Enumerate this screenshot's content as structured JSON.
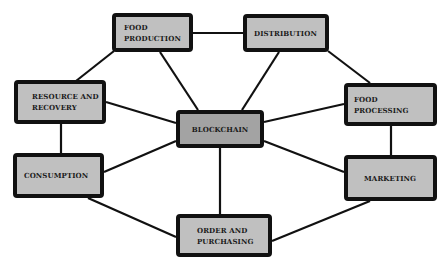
{
  "diagram": {
    "title": "",
    "colors": {
      "node_fill": "#c0c0c0",
      "central_fill": "#a3a3a3",
      "border": "#111111",
      "edge": "#111111",
      "background": "#ffffff"
    },
    "nodes": [
      {
        "id": "food_production",
        "label": "FOOD\nPRODUCTION",
        "x": 112,
        "y": 13,
        "w": 81,
        "h": 39,
        "pad": 8,
        "central": false
      },
      {
        "id": "distribution",
        "label": "DISTRIBUTION",
        "x": 243,
        "y": 14,
        "w": 86,
        "h": 38,
        "pad": 7,
        "central": false
      },
      {
        "id": "resource_recovery",
        "label": "RESOURCE AND\nRECOVERY",
        "x": 14,
        "y": 80,
        "w": 92,
        "h": 44,
        "pad": 14,
        "central": false
      },
      {
        "id": "blockchain",
        "label": "BLOCKCHAIN",
        "x": 176,
        "y": 110,
        "w": 88,
        "h": 38,
        "pad": 0,
        "central": true
      },
      {
        "id": "food_processing",
        "label": "FOOD PROCESSING",
        "x": 344,
        "y": 83,
        "w": 93,
        "h": 43,
        "pad": 6,
        "central": false
      },
      {
        "id": "consumption",
        "label": "CONSUMPTION",
        "x": 13,
        "y": 153,
        "w": 91,
        "h": 45,
        "pad": 7,
        "central": false
      },
      {
        "id": "marketing",
        "label": "MARKETING",
        "x": 344,
        "y": 155,
        "w": 93,
        "h": 46,
        "pad": 16,
        "central": false
      },
      {
        "id": "order_purchasing",
        "label": "ORDER AND\nPURCHASING",
        "x": 176,
        "y": 214,
        "w": 96,
        "h": 43,
        "pad": 17,
        "central": false
      }
    ],
    "edges": [
      {
        "from": "food_production",
        "to": "distribution",
        "x1": 193,
        "y1": 33,
        "x2": 243,
        "y2": 33
      },
      {
        "from": "food_production",
        "to": "resource_recovery",
        "x1": 114,
        "y1": 51,
        "x2": 76,
        "y2": 81
      },
      {
        "from": "food_production",
        "to": "blockchain",
        "x1": 160,
        "y1": 52,
        "x2": 198,
        "y2": 110
      },
      {
        "from": "distribution",
        "to": "blockchain",
        "x1": 279,
        "y1": 52,
        "x2": 242,
        "y2": 110
      },
      {
        "from": "distribution",
        "to": "food_processing",
        "x1": 328,
        "y1": 51,
        "x2": 370,
        "y2": 83
      },
      {
        "from": "resource_recovery",
        "to": "blockchain",
        "x1": 106,
        "y1": 102,
        "x2": 176,
        "y2": 123
      },
      {
        "from": "resource_recovery",
        "to": "consumption",
        "x1": 61,
        "y1": 124,
        "x2": 61,
        "y2": 153
      },
      {
        "from": "food_processing",
        "to": "blockchain",
        "x1": 344,
        "y1": 104,
        "x2": 264,
        "y2": 122
      },
      {
        "from": "food_processing",
        "to": "marketing",
        "x1": 391,
        "y1": 126,
        "x2": 391,
        "y2": 155
      },
      {
        "from": "consumption",
        "to": "blockchain",
        "x1": 104,
        "y1": 172,
        "x2": 176,
        "y2": 141
      },
      {
        "from": "marketing",
        "to": "blockchain",
        "x1": 344,
        "y1": 172,
        "x2": 264,
        "y2": 141
      },
      {
        "from": "blockchain",
        "to": "order_purchasing",
        "x1": 220,
        "y1": 148,
        "x2": 220,
        "y2": 214
      },
      {
        "from": "consumption",
        "to": "order_purchasing",
        "x1": 88,
        "y1": 198,
        "x2": 176,
        "y2": 237
      },
      {
        "from": "marketing",
        "to": "order_purchasing",
        "x1": 370,
        "y1": 201,
        "x2": 272,
        "y2": 241
      }
    ]
  }
}
